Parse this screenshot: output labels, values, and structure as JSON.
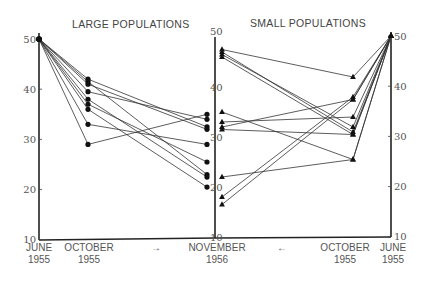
{
  "chart_data": [
    {
      "type": "line",
      "title": "LARGE POPULATIONS",
      "xlabel": "",
      "ylabel": "",
      "categories": [
        "JUNE 1955",
        "OCTOBER 1955",
        "NOVEMBER 1956"
      ],
      "ylim": [
        10,
        50
      ],
      "yticks": [
        10,
        20,
        30,
        40,
        50
      ],
      "marker": "circle",
      "arrow": "right",
      "series": [
        {
          "name": "L1",
          "values": [
            50,
            42,
            32.5
          ]
        },
        {
          "name": "L2",
          "values": [
            50,
            41.5,
            23
          ]
        },
        {
          "name": "L3",
          "values": [
            50,
            41,
            32
          ]
        },
        {
          "name": "L4",
          "values": [
            50,
            39.5,
            34
          ]
        },
        {
          "name": "L5",
          "values": [
            50,
            38,
            22.5
          ]
        },
        {
          "name": "L6",
          "values": [
            50,
            37,
            25.5
          ]
        },
        {
          "name": "L7",
          "values": [
            50,
            36,
            20.5
          ]
        },
        {
          "name": "L8",
          "values": [
            50,
            33,
            29
          ]
        },
        {
          "name": "L9",
          "values": [
            50,
            29,
            35
          ]
        }
      ]
    },
    {
      "type": "line",
      "title": "SMALL POPULATIONS",
      "xlabel": "",
      "ylabel": "",
      "categories": [
        "NOVEMBER 1956",
        "OCTOBER 1955",
        "JUNE 1955"
      ],
      "ylim": [
        10,
        50
      ],
      "yticks": [
        10,
        20,
        30,
        40,
        50
      ],
      "marker": "triangle",
      "arrow": "left",
      "series": [
        {
          "name": "S1",
          "values": [
            47.5,
            42,
            50
          ]
        },
        {
          "name": "S2",
          "values": [
            47,
            31,
            50
          ]
        },
        {
          "name": "S3",
          "values": [
            46.5,
            32,
            50
          ]
        },
        {
          "name": "S4",
          "values": [
            46,
            30.5,
            50
          ]
        },
        {
          "name": "S5",
          "values": [
            35,
            25.5,
            50
          ]
        },
        {
          "name": "S6",
          "values": [
            33,
            34,
            50
          ]
        },
        {
          "name": "S7",
          "values": [
            32,
            37.5,
            50
          ]
        },
        {
          "name": "S8",
          "values": [
            31.5,
            30.5,
            50
          ]
        },
        {
          "name": "S9",
          "values": [
            22,
            25.5,
            50
          ]
        },
        {
          "name": "S10",
          "values": [
            18,
            38,
            50
          ]
        },
        {
          "name": "S11",
          "values": [
            16.5,
            37.5,
            50
          ]
        }
      ]
    }
  ],
  "labels": {
    "large_title": "LARGE POPULATIONS",
    "small_title": "SMALL POPULATIONS",
    "x_left_june": [
      "JUNE",
      "1955"
    ],
    "x_left_october": [
      "OCTOBER",
      "1955"
    ],
    "x_middle_november": [
      "NOVEMBER",
      "1956"
    ],
    "x_right_october": [
      "OCTOBER",
      "1955"
    ],
    "x_right_june": [
      "JUNE",
      "1955"
    ],
    "arrow_right": "→",
    "arrow_left": "←"
  },
  "colors": {
    "ink": "#222222",
    "text": "#555555",
    "background": "#ffffff"
  }
}
